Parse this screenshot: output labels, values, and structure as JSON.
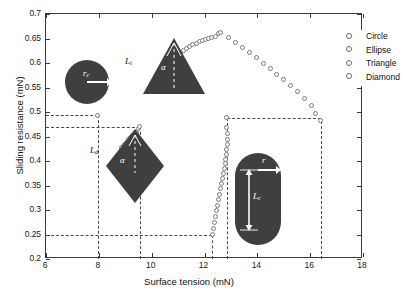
{
  "chart_data": {
    "type": "scatter",
    "title": "",
    "xlabel": "Surface tension (mN)",
    "ylabel": "Sliding resistance (mN)",
    "xlim": [
      6,
      18
    ],
    "ylim": [
      0.2,
      0.7
    ],
    "xticks": [
      6,
      8,
      10,
      12,
      14,
      16,
      18
    ],
    "yticks": [
      0.2,
      0.25,
      0.3,
      0.35,
      0.4,
      0.45,
      0.5,
      0.55,
      0.6,
      0.65,
      0.7
    ],
    "grid": false,
    "legend_position": "top-right",
    "legend": [
      "Circle",
      "Ellipse",
      "Triangle",
      "Diamond"
    ],
    "marker": "open-circle",
    "series": [
      {
        "name": "Circle",
        "points": [
          [
            7.95,
            0.493
          ]
        ]
      },
      {
        "name": "Diamond",
        "points": [
          [
            8.86,
            0.4275
          ],
          [
            8.93,
            0.432
          ],
          [
            9.0,
            0.4363
          ],
          [
            9.07,
            0.4404
          ],
          [
            9.14,
            0.4443
          ],
          [
            9.21,
            0.448
          ],
          [
            9.28,
            0.4516
          ],
          [
            9.35,
            0.4551
          ],
          [
            9.42,
            0.4586
          ],
          [
            9.49,
            0.4655
          ],
          [
            9.55,
            0.47
          ]
        ]
      },
      {
        "name": "Ellipse",
        "points": [
          [
            12.3,
            0.25
          ],
          [
            12.34,
            0.262
          ],
          [
            12.38,
            0.274
          ],
          [
            12.42,
            0.286
          ],
          [
            12.46,
            0.298
          ],
          [
            12.5,
            0.3095
          ],
          [
            12.54,
            0.321
          ],
          [
            12.58,
            0.332
          ],
          [
            12.62,
            0.343
          ],
          [
            12.66,
            0.3535
          ],
          [
            12.7,
            0.364
          ],
          [
            12.73,
            0.374
          ],
          [
            12.76,
            0.384
          ],
          [
            12.79,
            0.394
          ],
          [
            12.81,
            0.404
          ],
          [
            12.83,
            0.414
          ],
          [
            12.85,
            0.424
          ],
          [
            12.86,
            0.434
          ],
          [
            12.87,
            0.444
          ],
          [
            12.86,
            0.456
          ],
          [
            12.85,
            0.468
          ],
          [
            12.85,
            0.488
          ]
        ]
      },
      {
        "name": "Triangle",
        "points": [
          [
            10.95,
            0.617
          ],
          [
            11.08,
            0.6215
          ],
          [
            11.2,
            0.6258
          ],
          [
            11.32,
            0.6298
          ],
          [
            11.44,
            0.6335
          ],
          [
            11.56,
            0.637
          ],
          [
            11.68,
            0.6402
          ],
          [
            11.8,
            0.6432
          ],
          [
            11.92,
            0.646
          ],
          [
            12.04,
            0.6485
          ],
          [
            12.16,
            0.6508
          ],
          [
            12.28,
            0.653
          ],
          [
            12.4,
            0.655
          ],
          [
            12.52,
            0.6605
          ],
          [
            12.62,
            0.663
          ],
          [
            12.92,
            0.652
          ],
          [
            13.18,
            0.642
          ],
          [
            13.44,
            0.632
          ],
          [
            13.7,
            0.6215
          ],
          [
            13.96,
            0.611
          ],
          [
            14.22,
            0.6
          ],
          [
            14.48,
            0.589
          ],
          [
            14.74,
            0.5775
          ],
          [
            15.0,
            0.566
          ],
          [
            15.26,
            0.554
          ],
          [
            15.52,
            0.5415
          ],
          [
            15.78,
            0.528
          ],
          [
            16.04,
            0.513
          ],
          [
            16.22,
            0.4975
          ],
          [
            16.4,
            0.482
          ]
        ]
      }
    ],
    "guide_lines": [
      {
        "type": "horizontal",
        "y": 0.493,
        "x_from": 6.0,
        "x_to": 7.95
      },
      {
        "type": "vertical",
        "x": 7.95,
        "y_from": 0.2,
        "y_to": 0.493
      },
      {
        "type": "horizontal",
        "y": 0.47,
        "x_from": 6.0,
        "x_to": 9.55
      },
      {
        "type": "vertical",
        "x": 9.55,
        "y_from": 0.2,
        "y_to": 0.47
      },
      {
        "type": "horizontal",
        "y": 0.25,
        "x_from": 6.0,
        "x_to": 12.3
      },
      {
        "type": "vertical",
        "x": 12.3,
        "y_from": 0.2,
        "y_to": 0.25
      },
      {
        "type": "horizontal",
        "y": 0.488,
        "x_from": 12.85,
        "x_to": 16.4
      },
      {
        "type": "vertical",
        "x": 12.85,
        "y_from": 0.2,
        "y_to": 0.488
      },
      {
        "type": "vertical",
        "x": 16.4,
        "y_from": 0.2,
        "y_to": 0.482
      }
    ],
    "annotations": [
      {
        "name": "circle-inset",
        "labels": [
          "r_c"
        ]
      },
      {
        "name": "triangle-inset",
        "labels": [
          "L_t",
          "alpha"
        ]
      },
      {
        "name": "diamond-inset",
        "labels": [
          "L_d",
          "alpha"
        ]
      },
      {
        "name": "capsule-inset",
        "labels": [
          "r",
          "L_c"
        ]
      }
    ]
  },
  "axis": {
    "xlabel": "Surface tension (mN)",
    "ylabel": "Sliding resistance (mN)",
    "xticklabels": [
      "6",
      "8",
      "10",
      "12",
      "14",
      "16",
      "18"
    ],
    "yticklabels": [
      "0.2",
      "0.25",
      "0.3",
      "0.35",
      "0.4",
      "0.45",
      "0.5",
      "0.55",
      "0.6",
      "0.65",
      "0.7"
    ]
  },
  "legend": {
    "items": [
      {
        "label": "Circle"
      },
      {
        "label": "Ellipse"
      },
      {
        "label": "Triangle"
      },
      {
        "label": "Diamond"
      }
    ]
  },
  "insets": {
    "circle": {
      "radius_label": "r",
      "radius_sub": "c"
    },
    "triangle": {
      "side_label": "L",
      "side_sub": "t",
      "angle_label": "α"
    },
    "diamond": {
      "side_label": "L",
      "side_sub": "d",
      "angle_label": "α"
    },
    "capsule": {
      "radius_label": "r",
      "length_label": "L",
      "length_sub": "c"
    }
  },
  "colors": {
    "axis": "#3a3a3a",
    "marker_edge": "#7b7b7b",
    "shape_fill": "#3f3f3f",
    "guide": "#4a4a4a",
    "text": "#111111"
  }
}
